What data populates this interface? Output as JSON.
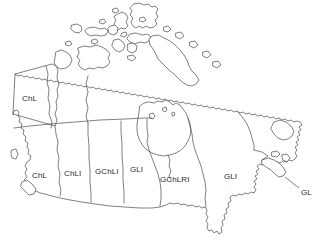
{
  "figure": {
    "kind": "outline-map",
    "background_color": "#ffffff",
    "outline_color": "#4a4a4a",
    "label_color": "#2b2b2b"
  },
  "map": {
    "regions": [
      {
        "id": "yukon",
        "label": "ChL",
        "x": 22,
        "y": 95
      },
      {
        "id": "british-columbia",
        "label": "ChL",
        "x": 32,
        "y": 172
      },
      {
        "id": "alberta",
        "label": "ChLI",
        "x": 64,
        "y": 170
      },
      {
        "id": "saskatchewan",
        "label": "GChLI",
        "x": 95,
        "y": 168
      },
      {
        "id": "manitoba",
        "label": "GLI",
        "x": 130,
        "y": 166
      },
      {
        "id": "ontario",
        "label": "GChLRI",
        "x": 160,
        "y": 176
      },
      {
        "id": "quebec",
        "label": "GLI",
        "x": 224,
        "y": 173
      },
      {
        "id": "maritimes",
        "label": "GL",
        "x": 301,
        "y": 189
      }
    ],
    "leader_lines": [
      {
        "id": "maritimes-leader",
        "from_x": 299,
        "from_y": 188,
        "to_x": 285,
        "to_y": 177
      }
    ]
  }
}
